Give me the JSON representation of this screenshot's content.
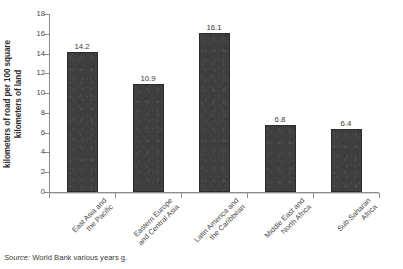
{
  "chart_data": {
    "type": "bar",
    "title": "",
    "subtitle": "",
    "xlabel": "",
    "ylabel": "kilometers of road per 100 square kilometers of land",
    "ylabel_lines": [
      "kilometers of road per 100 square",
      "kilometers of land"
    ],
    "categories": [
      "East Asia and the Pacific",
      "Eastern Europe and Central Asia",
      "Latin America and the Caribbean",
      "Middle East and North Africa",
      "Sub-Saharan Africa"
    ],
    "category_lines": [
      [
        "East Asia and",
        "the Pacific"
      ],
      [
        "Eastern Europe",
        "and Central Asia"
      ],
      [
        "Latin America and",
        "the Caribbean"
      ],
      [
        "Middle East and",
        "North Africa"
      ],
      [
        "Sub-Saharan",
        "Africa"
      ]
    ],
    "values": [
      14.2,
      10.9,
      16.1,
      6.8,
      6.4
    ],
    "value_labels": [
      "14.2",
      "10.9",
      "16.1",
      "6.8",
      "6.4"
    ],
    "ylim": [
      0,
      18
    ],
    "ytick_labels": [
      "0",
      "2",
      "4",
      "6",
      "8",
      "10",
      "12",
      "14",
      "16",
      "18"
    ],
    "ytick_values": [
      0,
      2,
      4,
      6,
      8,
      10,
      12,
      14,
      16,
      18
    ],
    "grid": false,
    "legend": "none",
    "bar_color": "#3f3f3f",
    "axis_color": "#8c8c8c",
    "text_color": "#3c3c3c"
  },
  "source": {
    "prefix": "Source:",
    "text": "World Bank various years g."
  }
}
